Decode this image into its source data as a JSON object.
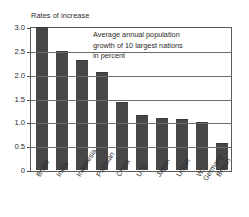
{
  "chart_data": {
    "type": "bar",
    "title": "Rates of increase",
    "annotation": [
      "Average annual population",
      "growth of 10 largest nations",
      "in percent"
    ],
    "categories": [
      "Brazil",
      "India",
      "Indonesia",
      "Pakistan",
      "China",
      "U.S.",
      "Japan",
      "USSR",
      "W. Germany",
      "Britain"
    ],
    "category_lines": [
      [
        "Brazil"
      ],
      [
        "India"
      ],
      [
        "Indonesia"
      ],
      [
        "Pakistan"
      ],
      [
        "China"
      ],
      [
        "U.S."
      ],
      [
        "Japan"
      ],
      [
        "USSR"
      ],
      [
        "W.",
        "Germany"
      ],
      [
        "Britain"
      ]
    ],
    "values": [
      3.0,
      2.5,
      2.3,
      2.05,
      1.42,
      1.15,
      1.09,
      1.08,
      1.0,
      0.56
    ],
    "xlabel": "",
    "ylabel": "Rates of increase",
    "ylim": [
      0,
      3.0
    ],
    "yticks": [
      0,
      0.5,
      1.0,
      1.5,
      2.0,
      2.5,
      3.0
    ],
    "ytick_labels": [
      "0",
      "0.5",
      "1.0",
      "1.5",
      "2.0",
      "2.5",
      "3.0"
    ],
    "grid": true,
    "legend": "none",
    "bar_color": "#474747",
    "grid_color": "#6b6b6b",
    "frame_color": "#5c5c5c"
  }
}
